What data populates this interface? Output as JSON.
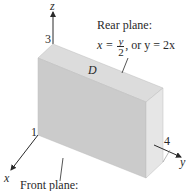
{
  "diagram": {
    "axes": {
      "x": {
        "label": "x",
        "tick_label": "1"
      },
      "y": {
        "label": "y",
        "tick_label": "4"
      },
      "z": {
        "label": "z",
        "tick_label": "3"
      }
    },
    "region_label": "D",
    "rear_plane": {
      "title": "Rear plane:",
      "equation_lhs": "x =",
      "frac_num": "y",
      "frac_den": "2",
      "equation_rest": ", or y = 2x"
    },
    "front_plane": {
      "title": "Front plane:"
    },
    "colors": {
      "front_face": "#c8c8c8",
      "top_face": "#dadada",
      "side_face": "#bdbdbd",
      "axis": "#2a2a2a"
    }
  }
}
